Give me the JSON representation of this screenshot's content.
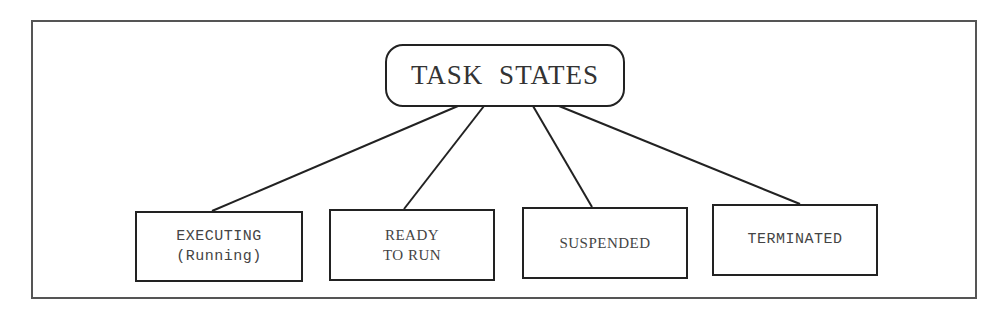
{
  "diagram": {
    "root": {
      "label": "TASK STATES"
    },
    "children": [
      {
        "line1": "EXECUTING",
        "line2": "(Running)"
      },
      {
        "line1": "READY",
        "line2": "TO RUN"
      },
      {
        "line1": "SUSPENDED",
        "line2": ""
      },
      {
        "line1": "TERMINATED",
        "line2": ""
      }
    ],
    "colors": {
      "stroke": "#222222",
      "frame": "#555555",
      "text": "#333333",
      "background": "#ffffff"
    }
  }
}
